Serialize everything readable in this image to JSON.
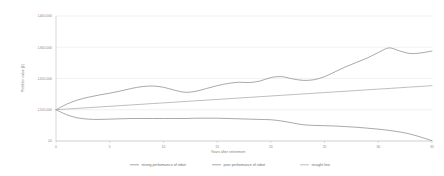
{
  "chart_data": {
    "type": "line",
    "title": "",
    "xlabel": "Years after retirement",
    "ylabel": "Portfolio value (£)",
    "xlim": [
      0,
      35
    ],
    "ylim": [
      0,
      400000
    ],
    "grid": true,
    "legend_position": "bottom",
    "x_ticks": [
      "0",
      "5",
      "10",
      "15",
      "20",
      "25",
      "30",
      "35"
    ],
    "x_tick_values": [
      0,
      5,
      10,
      15,
      20,
      25,
      30,
      35
    ],
    "y_ticks": [
      "£0",
      "£100,000",
      "£200,000",
      "£300,000",
      "£400,000"
    ],
    "y_tick_values": [
      0,
      100000,
      200000,
      300000,
      400000
    ],
    "x": [
      0,
      1,
      2,
      3,
      4,
      5,
      6,
      7,
      8,
      9,
      10,
      11,
      12,
      13,
      14,
      15,
      16,
      17,
      18,
      19,
      20,
      21,
      22,
      23,
      24,
      25,
      26,
      27,
      28,
      29,
      30,
      31,
      32,
      33,
      34,
      35
    ],
    "series": [
      {
        "name": "strong performance of robot",
        "color": "#8c8c8c",
        "values": [
          100000,
          118000,
          131000,
          140000,
          147000,
          153000,
          160000,
          168000,
          174000,
          176000,
          172000,
          163000,
          156000,
          159000,
          168000,
          177000,
          184000,
          188000,
          187000,
          192000,
          203000,
          206000,
          199000,
          194000,
          196000,
          206000,
          222000,
          238000,
          252000,
          266000,
          283000,
          298000,
          288000,
          280000,
          282000,
          288000
        ]
      },
      {
        "name": "poor performance of robot",
        "color": "#8c8c8c",
        "values": [
          100000,
          84000,
          74000,
          70000,
          69000,
          70000,
          71000,
          72000,
          72000,
          72000,
          72000,
          72000,
          72000,
          73000,
          73000,
          73000,
          72000,
          71000,
          70000,
          69000,
          68000,
          64000,
          58000,
          52000,
          50000,
          49000,
          48000,
          46000,
          44000,
          41000,
          38000,
          34000,
          29000,
          22000,
          12000,
          1000
        ]
      },
      {
        "name": "straight line",
        "color": "#a8a8a8",
        "values": [
          100000,
          102200,
          104400,
          106600,
          108800,
          111000,
          113200,
          115400,
          117600,
          119800,
          122000,
          124200,
          126400,
          128600,
          130800,
          133000,
          135200,
          137400,
          139600,
          141800,
          144000,
          146200,
          148400,
          150600,
          152800,
          155000,
          157200,
          159400,
          161600,
          163800,
          166000,
          168200,
          170400,
          172600,
          174800,
          177000
        ]
      }
    ]
  },
  "style": {
    "grid_color": "#e4e4e4",
    "axis_color": "#bdbdbd",
    "background": "#ffffff"
  }
}
